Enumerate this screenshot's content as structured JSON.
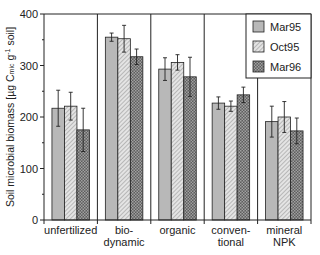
{
  "chart_data": {
    "type": "bar",
    "title": "",
    "xlabel": "",
    "ylabel": "Soil microbial biomass [µg C mic g-1 soil]",
    "ylabel_parts": {
      "main": "Soil microbial biomass [µg C",
      "sub": "mic",
      "mid": " g",
      "sup": "-1",
      "end": " soil]"
    },
    "ylim": [
      0,
      400
    ],
    "yticks": [
      0,
      100,
      200,
      300,
      400
    ],
    "grid": false,
    "legend_position": "upper right (inside)",
    "categories": [
      [
        "unfertilized"
      ],
      [
        "bio-",
        "dynamic"
      ],
      [
        "organic"
      ],
      [
        "conven-",
        "tional"
      ],
      [
        "mineral",
        "NPK"
      ]
    ],
    "category_names": [
      "unfertilized",
      "bio-dynamic",
      "organic",
      "conventional",
      "mineral NPK"
    ],
    "series": [
      {
        "name": "Mar95",
        "pattern": "solid-light-gray",
        "values": [
          217,
          355,
          293,
          227,
          191
        ],
        "errors": [
          35,
          8,
          22,
          12,
          30
        ]
      },
      {
        "name": "Oct95",
        "pattern": "diagonal-hatch",
        "values": [
          221,
          352,
          306,
          221,
          200
        ],
        "errors": [
          27,
          26,
          15,
          10,
          30
        ]
      },
      {
        "name": "Mar96",
        "pattern": "dark-crosshatch",
        "values": [
          175,
          317,
          278,
          243,
          173
        ],
        "errors": [
          42,
          15,
          38,
          15,
          25
        ]
      }
    ]
  },
  "legend": {
    "items": [
      {
        "label": "Mar95"
      },
      {
        "label": "Oct95"
      },
      {
        "label": "Mar96"
      }
    ]
  },
  "colors": {
    "mar95_fill": "#b8b8b8",
    "oct95_fill": "#d8d8d8",
    "mar96_fill": "#6e6e6e",
    "axis": "#222222"
  }
}
